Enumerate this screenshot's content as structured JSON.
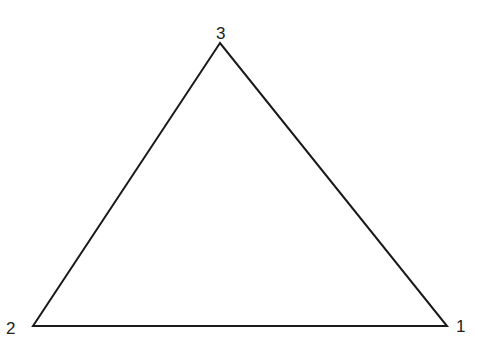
{
  "diagram": {
    "type": "triangle",
    "stroke_color": "#1a1a1a",
    "vertices": [
      {
        "label": "1",
        "x": 447,
        "y": 326
      },
      {
        "label": "2",
        "x": 33,
        "y": 326
      },
      {
        "label": "3",
        "x": 220,
        "y": 43
      }
    ]
  }
}
